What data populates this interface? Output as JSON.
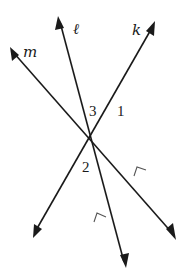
{
  "diagram": {
    "colors": {
      "ink": "#1a1a1a",
      "tick": "#555555",
      "background": "#ffffff"
    },
    "lines": [
      {
        "id": "l",
        "label": "ℓ",
        "parallel_group": "A"
      },
      {
        "id": "k",
        "label": "k",
        "role": "transversal"
      },
      {
        "id": "m",
        "label": "m",
        "parallel_group": "A"
      }
    ],
    "angles": [
      {
        "id": "1",
        "label": "1",
        "at_intersection": "l-k",
        "position": "right"
      },
      {
        "id": "3",
        "label": "3",
        "at_intersection": "l-k",
        "position": "left"
      },
      {
        "id": "2",
        "label": "2",
        "at_intersection": "m-k",
        "position": "right"
      }
    ],
    "parallel_markers": [
      {
        "on_line": "l",
        "symbol": "arrowhead-tick"
      },
      {
        "on_line": "m",
        "symbol": "arrowhead-tick"
      }
    ]
  }
}
